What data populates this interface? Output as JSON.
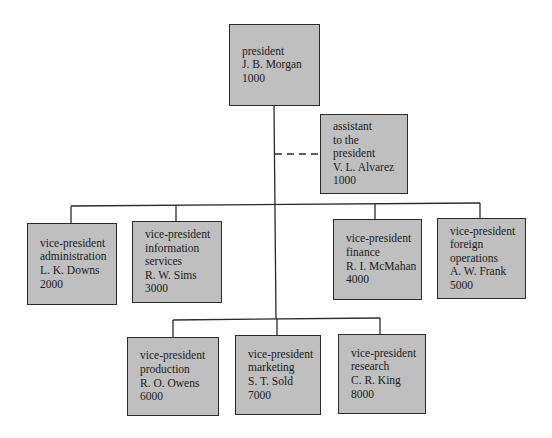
{
  "org_chart": {
    "president": {
      "lines": [
        "president",
        "J. B. Morgan",
        "1000"
      ]
    },
    "assistant": {
      "lines": [
        "assistant",
        "to the",
        "president",
        "V. L. Alvarez",
        "1000"
      ],
      "relation": "staff (dashed)"
    },
    "vice_presidents_row1": [
      {
        "lines": [
          "vice-president",
          "administration",
          "L. K. Downs",
          "2000"
        ]
      },
      {
        "lines": [
          "vice-president",
          "information",
          "services",
          "R. W. Sims",
          "3000"
        ]
      },
      {
        "lines": [
          "vice-president",
          "finance",
          "R. I. McMahan",
          "4000"
        ]
      },
      {
        "lines": [
          "vice-president",
          "foreign",
          "operations",
          "A. W. Frank",
          "5000"
        ]
      }
    ],
    "vice_presidents_row2": [
      {
        "lines": [
          "vice-president",
          "production",
          "R. O. Owens",
          "6000"
        ]
      },
      {
        "lines": [
          "vice-president",
          "marketing",
          "S. T. Sold",
          "7000"
        ]
      },
      {
        "lines": [
          "vice-president",
          "research",
          "C. R. King",
          "8000"
        ]
      }
    ],
    "colors": {
      "box_fill": "#bfbfbf",
      "line": "#2a2a2a"
    }
  }
}
